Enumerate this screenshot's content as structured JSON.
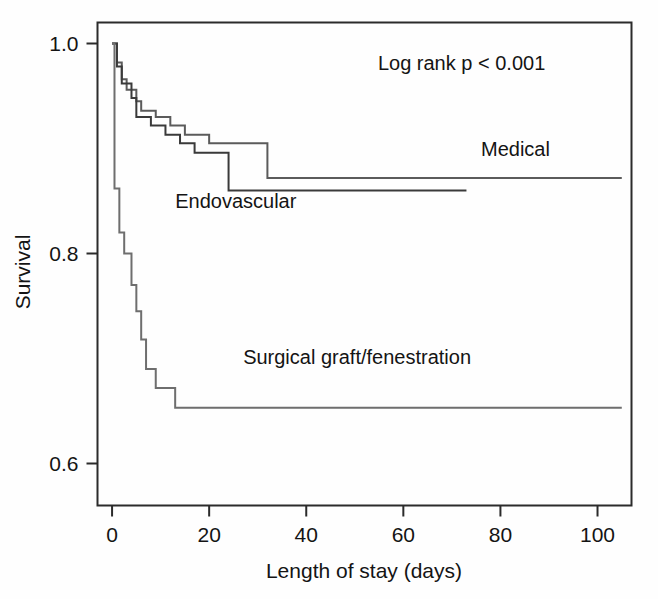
{
  "chart_data": {
    "type": "line",
    "subtype": "kaplan-meier-step",
    "title": "",
    "xlabel": "Length of stay (days)",
    "ylabel": "Survival",
    "xlim": [
      -3,
      107
    ],
    "ylim": [
      0.56,
      1.02
    ],
    "xticks": [
      0,
      20,
      40,
      60,
      80,
      100
    ],
    "xtick_labels": [
      "0",
      "20",
      "40",
      "60",
      "80",
      "100"
    ],
    "yticks": [
      0.6,
      0.8,
      1.0
    ],
    "ytick_labels": [
      "0.6",
      "0.8",
      "1.0"
    ],
    "grid": false,
    "legend": "inline-labels",
    "annotations": [
      {
        "name": "log-rank-annotation",
        "text": "Log rank p < 0.001",
        "x": 72,
        "y": 0.975
      }
    ],
    "series": [
      {
        "name": "Medical",
        "label": "Medical",
        "color": "#5b5b5b",
        "label_x": 76,
        "label_y": 0.893,
        "points": [
          [
            0,
            1.0
          ],
          [
            1,
            1.0
          ],
          [
            1,
            0.982
          ],
          [
            2,
            0.982
          ],
          [
            2,
            0.966
          ],
          [
            3,
            0.966
          ],
          [
            3,
            0.956
          ],
          [
            5,
            0.956
          ],
          [
            5,
            0.945
          ],
          [
            6,
            0.945
          ],
          [
            6,
            0.936
          ],
          [
            9,
            0.936
          ],
          [
            9,
            0.93
          ],
          [
            12,
            0.93
          ],
          [
            12,
            0.922
          ],
          [
            15,
            0.922
          ],
          [
            15,
            0.913
          ],
          [
            20,
            0.913
          ],
          [
            20,
            0.905
          ],
          [
            32,
            0.905
          ],
          [
            32,
            0.872
          ],
          [
            105,
            0.872
          ]
        ]
      },
      {
        "name": "Endovascular",
        "label": "Endovascular",
        "color": "#3a3a3a",
        "label_x": 13,
        "label_y": 0.843,
        "points": [
          [
            0,
            1.0
          ],
          [
            1,
            1.0
          ],
          [
            1,
            0.978
          ],
          [
            2,
            0.978
          ],
          [
            2,
            0.962
          ],
          [
            4,
            0.962
          ],
          [
            4,
            0.948
          ],
          [
            5,
            0.948
          ],
          [
            5,
            0.93
          ],
          [
            8,
            0.93
          ],
          [
            8,
            0.922
          ],
          [
            11,
            0.922
          ],
          [
            11,
            0.913
          ],
          [
            14,
            0.913
          ],
          [
            14,
            0.905
          ],
          [
            17,
            0.905
          ],
          [
            17,
            0.896
          ],
          [
            24,
            0.896
          ],
          [
            24,
            0.86
          ],
          [
            73,
            0.86
          ]
        ]
      },
      {
        "name": "Surgical graft/fenestration",
        "label": "Surgical graft/fenestration",
        "color": "#6e6e6e",
        "label_x": 27,
        "label_y": 0.695,
        "points": [
          [
            0,
            1.0
          ],
          [
            0.5,
            1.0
          ],
          [
            0.5,
            0.862
          ],
          [
            1.5,
            0.862
          ],
          [
            1.5,
            0.82
          ],
          [
            2.5,
            0.82
          ],
          [
            2.5,
            0.8
          ],
          [
            4,
            0.8
          ],
          [
            4,
            0.77
          ],
          [
            5,
            0.77
          ],
          [
            5,
            0.745
          ],
          [
            6,
            0.745
          ],
          [
            6,
            0.718
          ],
          [
            7,
            0.718
          ],
          [
            7,
            0.69
          ],
          [
            9,
            0.69
          ],
          [
            9,
            0.672
          ],
          [
            13,
            0.672
          ],
          [
            13,
            0.653
          ],
          [
            105,
            0.653
          ]
        ]
      }
    ]
  },
  "figure": {
    "background_color": "#ffffff",
    "frame_color": "#2b2b2b",
    "axis_label_x": "Length of stay (days)",
    "axis_label_y": "Survival"
  }
}
